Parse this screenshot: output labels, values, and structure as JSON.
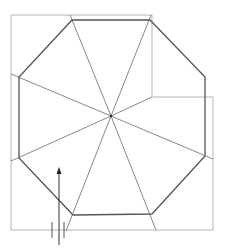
{
  "diagram": {
    "type": "octagonal hip roof plan",
    "colors": {
      "outline": "#b4b4b4",
      "eave": "#555555",
      "ridge": "#7a7a7a",
      "arrow": "#333333"
    },
    "outline_points": "11,15 152,15 152,97 213,97 213,230 11,230 11,15",
    "octagon_points": "72,20 150,20 205,77 205,156 152,214 73,215 19,158 19,77",
    "center": {
      "x": 111,
      "y": 116
    },
    "ridges": [
      {
        "x1": 111,
        "y1": 116,
        "x2": 70,
        "y2": 15
      },
      {
        "x1": 111,
        "y1": 116,
        "x2": 151,
        "y2": 15
      },
      {
        "x1": 111,
        "y1": 116,
        "x2": 152,
        "y2": 97
      },
      {
        "x1": 111,
        "y1": 116,
        "x2": 213,
        "y2": 159
      },
      {
        "x1": 111,
        "y1": 116,
        "x2": 156,
        "y2": 230
      },
      {
        "x1": 111,
        "y1": 116,
        "x2": 66,
        "y2": 231
      },
      {
        "x1": 111,
        "y1": 116,
        "x2": 11,
        "y2": 161
      },
      {
        "x1": 111,
        "y1": 116,
        "x2": 11,
        "y2": 74
      }
    ],
    "north_arrow": {
      "shaft": {
        "x1": 59,
        "y1": 172,
        "x2": 59,
        "y2": 245
      },
      "head_points": "59,167 56.5,174 61.5,174",
      "ticks": [
        {
          "x1": 52,
          "y1": 222,
          "x2": 52,
          "y2": 238
        },
        {
          "x1": 64,
          "y1": 222,
          "x2": 64,
          "y2": 238
        }
      ]
    }
  }
}
